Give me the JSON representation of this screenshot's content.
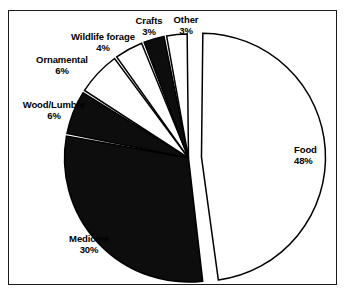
{
  "chart_data": {
    "type": "pie",
    "title": "",
    "subtitle": "",
    "legend_position": "none",
    "grid": false,
    "explode": [
      "Food"
    ],
    "start_angle_deg": 0,
    "direction": "clockwise",
    "categories": [
      "Food",
      "Medicine",
      "Wood/Lumber",
      "Ornamental",
      "Wildlife forage",
      "Crafts",
      "Other"
    ],
    "values": [
      48,
      30,
      6,
      6,
      4,
      3,
      3
    ],
    "unit": "%",
    "slices": [
      {
        "label": "Food",
        "value": 48,
        "value_text": "48%",
        "fill": "#ffffff",
        "outline": "#000000"
      },
      {
        "label": "Medicine",
        "value": 30,
        "value_text": "30%",
        "fill": "#0d0d0d",
        "outline": "#000000"
      },
      {
        "label": "Wood/Lumber",
        "value": 6,
        "value_text": "6%",
        "fill": "#0d0d0d",
        "outline": "#000000"
      },
      {
        "label": "Ornamental",
        "value": 6,
        "value_text": "6%",
        "fill": "#ffffff",
        "outline": "#000000"
      },
      {
        "label": "Wildlife forage",
        "value": 4,
        "value_text": "4%",
        "fill": "#ffffff",
        "outline": "#000000"
      },
      {
        "label": "Crafts",
        "value": 3,
        "value_text": "3%",
        "fill": "#0d0d0d",
        "outline": "#000000"
      },
      {
        "label": "Other",
        "value": 3,
        "value_text": "3%",
        "fill": "#ffffff",
        "outline": "#000000"
      }
    ]
  },
  "labels": {
    "food": {
      "name": "Food",
      "pct": "48%"
    },
    "medicine": {
      "name": "Medicine",
      "pct": "30%"
    },
    "wood": {
      "name": "Wood/Lumber",
      "pct": "6%"
    },
    "ornamental": {
      "name": "Ornamental",
      "pct": "6%"
    },
    "wildlife": {
      "name": "Wildlife forage",
      "pct": "4%"
    },
    "crafts": {
      "name": "Crafts",
      "pct": "3%"
    },
    "other": {
      "name": "Other",
      "pct": "3%"
    }
  },
  "style": {
    "frame_color": "#1a1a1a",
    "background": "#ffffff",
    "slice_black": "#0d0d0d",
    "slice_white": "#ffffff"
  }
}
